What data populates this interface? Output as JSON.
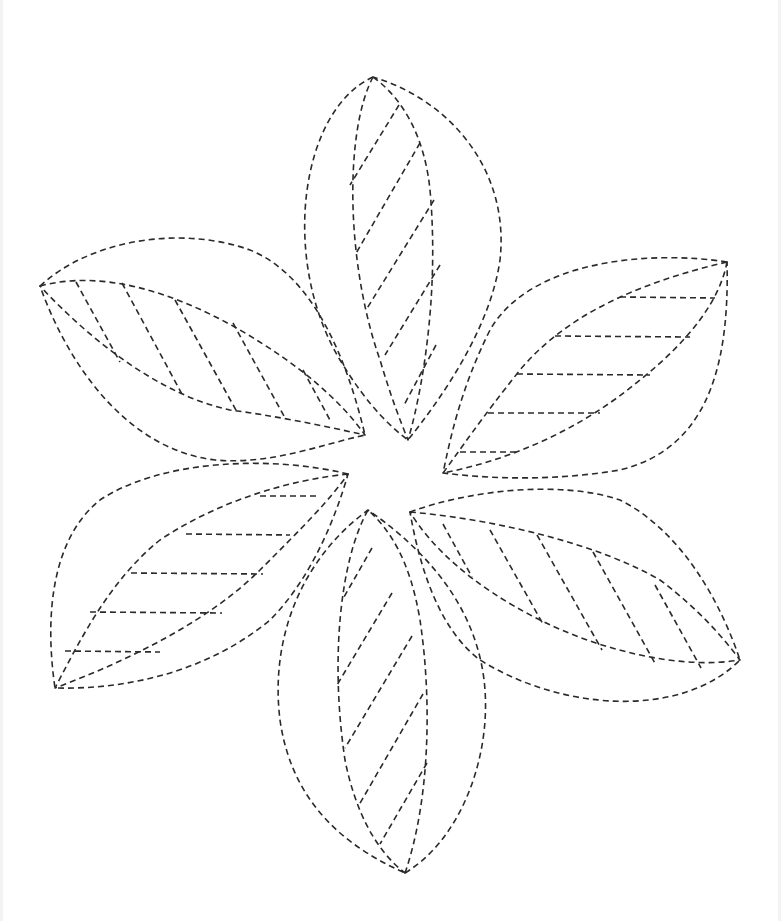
{
  "drawing": {
    "subject": "six-petal flower tracing outline",
    "style": "dashed-line",
    "stroke_color": "#2a2a2a",
    "background_color": "#ffffff",
    "petals": [
      {
        "name": "top",
        "outer": "M373,77 C300,110 280,260 340,360 C370,410 395,430 408,440 C440,400 490,330 500,260 C510,170 450,100 373,77 Z",
        "inner": "M373,77 C345,130 345,260 380,360 C392,400 400,420 408,440 C420,400 440,300 430,190 C425,140 405,100 373,77 Z",
        "hatches": [
          "M399,105 L350,185",
          "M420,143 L355,255",
          "M434,200 L366,310",
          "M440,265 L385,355",
          "M436,345 L403,407"
        ]
      },
      {
        "name": "upper-left",
        "outer": "M40,286 C90,240 180,225 250,250 C300,270 340,330 365,435 C320,445 270,465 215,460 C130,450 70,370 40,286 Z",
        "inner": "M40,286 C100,270 170,290 240,330 C300,365 340,400 365,435 C320,425 270,415 230,410 C160,395 90,340 40,286 Z",
        "hatches": [
          "M76,282 L120,362",
          "M122,283 L183,396",
          "M175,300 L237,412",
          "M233,323 L285,418",
          "M303,370 L330,420"
        ]
      },
      {
        "name": "upper-right",
        "outer": "M727,262 C650,250 530,260 490,330 C460,390 450,440 443,473 C500,480 560,480 620,470 C700,450 730,380 727,262 Z",
        "inner": "M727,262 C650,280 570,310 520,370 C480,420 460,450 443,473 C510,460 580,430 640,380 C690,340 720,300 727,262 Z",
        "hatches": [
          "M620,297 L715,298",
          "M555,336 L690,337",
          "M517,374 L650,375",
          "M488,413 L600,413",
          "M460,452 L520,452"
        ]
      },
      {
        "name": "lower-left",
        "outer": "M348,474 C270,455 160,460 100,500 C50,540 45,620 55,688 C130,690 210,670 270,620 C310,580 335,520 348,474 Z",
        "inner": "M348,474 C290,480 220,500 160,540 C110,580 80,640 55,688 C130,660 210,620 260,570 C300,530 330,500 348,474 Z",
        "hatches": [
          "M260,496 L320,496",
          "M186,534 L290,535",
          "M131,573 L263,574",
          "M90,612 L222,613",
          "M65,651 L160,652"
        ]
      },
      {
        "name": "lower-right",
        "outer": "M410,512 C470,490 560,480 620,500 C680,530 720,600 740,660 C680,720 560,710 480,660 C440,630 420,570 410,512 Z",
        "inner": "M410,512 C500,520 600,545 660,580 C700,610 725,640 740,660 C680,670 600,650 540,620 C470,585 430,545 410,512 Z",
        "hatches": [
          "M443,524 L472,577",
          "M490,530 L543,624",
          "M537,535 L602,650",
          "M593,552 L656,665",
          "M655,585 L701,668"
        ]
      },
      {
        "name": "bottom",
        "outer": "M405,873 C460,840 490,760 485,690 C480,620 440,560 368,510 C300,560 270,640 280,720 C290,790 330,840 405,873 Z",
        "inner": "M405,873 C430,800 432,700 420,620 C410,560 390,530 368,510 C340,560 330,660 345,760 C355,810 375,850 405,873 Z",
        "hatches": [
          "M372,548 L344,597",
          "M392,593 L337,685",
          "M412,636 L345,748",
          "M423,694 L359,805",
          "M427,763 L380,844"
        ]
      }
    ]
  }
}
